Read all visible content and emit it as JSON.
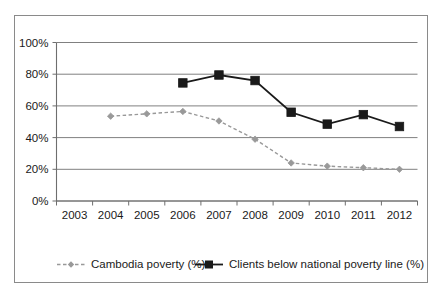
{
  "chart_data": {
    "type": "line",
    "title": "",
    "xlabel": "",
    "ylabel": "",
    "categories": [
      "2003",
      "2004",
      "2005",
      "2006",
      "2007",
      "2008",
      "2009",
      "2010",
      "2011",
      "2012"
    ],
    "ylim": [
      0,
      100
    ],
    "yticks": [
      0,
      20,
      40,
      60,
      80,
      100
    ],
    "ytick_labels": [
      "0%",
      "20%",
      "40%",
      "60%",
      "80%",
      "100%"
    ],
    "grid": true,
    "legend_position": "bottom",
    "series": [
      {
        "name": "Cambodia poverty (%)",
        "color": "#999999",
        "line_style": "dashed",
        "marker": "diamond",
        "values": [
          null,
          53.5,
          55,
          56.5,
          50.5,
          39,
          24,
          22,
          21,
          20
        ]
      },
      {
        "name": "Clients below national poverty line (%)",
        "color": "#1a1a1a",
        "line_style": "solid",
        "marker": "square",
        "values": [
          null,
          null,
          null,
          74.5,
          79.5,
          76,
          56,
          48.5,
          54.5,
          47
        ]
      }
    ]
  },
  "legend": {
    "items": [
      {
        "label": "Cambodia poverty (%)"
      },
      {
        "label": "Clients below national poverty line (%)"
      }
    ]
  }
}
